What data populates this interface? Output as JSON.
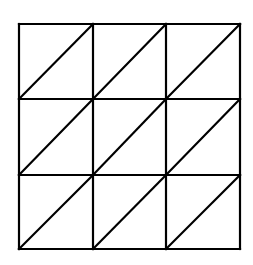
{
  "diagram": {
    "type": "triangulated-grid",
    "rows": 3,
    "cols": 3,
    "x_lines": [
      19,
      93,
      166,
      240
    ],
    "y_lines": [
      24,
      99,
      175,
      249
    ],
    "diagonal_direction": "bottom-left-to-top-right",
    "stroke_color": "#000000",
    "stroke_width": 2.2,
    "background": "#ffffff"
  }
}
